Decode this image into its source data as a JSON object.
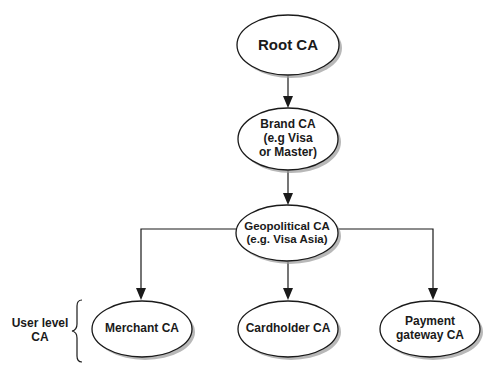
{
  "diagram": {
    "type": "hierarchy",
    "nodes": {
      "root": {
        "lines": [
          "Root CA"
        ]
      },
      "brand": {
        "lines": [
          "Brand CA",
          "(e.g Visa",
          "or Master)"
        ]
      },
      "geopolitical": {
        "lines": [
          "Geopolitical CA",
          "(e.g. Visa Asia)"
        ]
      },
      "merchant": {
        "lines": [
          "Merchant CA"
        ]
      },
      "cardholder": {
        "lines": [
          "Cardholder CA"
        ]
      },
      "payment": {
        "lines": [
          "Payment",
          "gateway CA"
        ]
      }
    },
    "edges": [
      {
        "from": "Root CA",
        "to": "Brand CA"
      },
      {
        "from": "Brand CA",
        "to": "Geopolitical CA"
      },
      {
        "from": "Geopolitical CA",
        "to": "Merchant CA"
      },
      {
        "from": "Geopolitical CA",
        "to": "Cardholder CA"
      },
      {
        "from": "Geopolitical CA",
        "to": "Payment gateway CA"
      }
    ],
    "group_label": {
      "lines": [
        "User level",
        "CA"
      ]
    },
    "colors": {
      "stroke": "#1a1a1a",
      "fill": "#ffffff",
      "shadow": "#9a9a9a"
    }
  }
}
